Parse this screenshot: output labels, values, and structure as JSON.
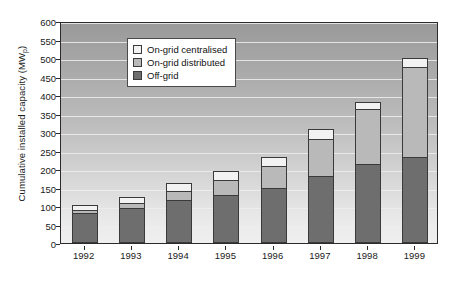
{
  "chart_data": {
    "type": "bar",
    "stacked": true,
    "title": "",
    "xlabel": "",
    "ylabel": "Cumulative installed capacity (MWp)",
    "ylabel_main": "Cumulative installed capacity (MW",
    "ylabel_sub": "p",
    "ylabel_tail": ")",
    "categories": [
      "1992",
      "1993",
      "1994",
      "1995",
      "1996",
      "1997",
      "1998",
      "1999"
    ],
    "series": [
      {
        "name": "Off-grid",
        "color": "#6e6e6e",
        "values": [
          80,
          95,
          115,
          130,
          150,
          180,
          213,
          232
        ]
      },
      {
        "name": "On-grid distributed",
        "color": "#b9b9b9",
        "values": [
          8,
          12,
          25,
          40,
          58,
          100,
          149,
          243
        ]
      },
      {
        "name": "On-grid centralised",
        "color": "#f2f2f2",
        "values": [
          14,
          18,
          22,
          25,
          25,
          28,
          18,
          25
        ]
      }
    ],
    "totals": [
      102,
      125,
      162,
      195,
      233,
      308,
      380,
      500
    ],
    "ylim": [
      0,
      600
    ],
    "ytick_step": 50,
    "yticks": [
      "0",
      "50",
      "100",
      "150",
      "200",
      "250",
      "300",
      "350",
      "400",
      "450",
      "500",
      "550",
      "600"
    ],
    "grid": true,
    "legend_position": "top-left",
    "legend": [
      {
        "label": "On-grid centralised",
        "color": "#f2f2f2"
      },
      {
        "label": "On-grid distributed",
        "color": "#b9b9b9"
      },
      {
        "label": "Off-grid",
        "color": "#6e6e6e"
      }
    ]
  }
}
